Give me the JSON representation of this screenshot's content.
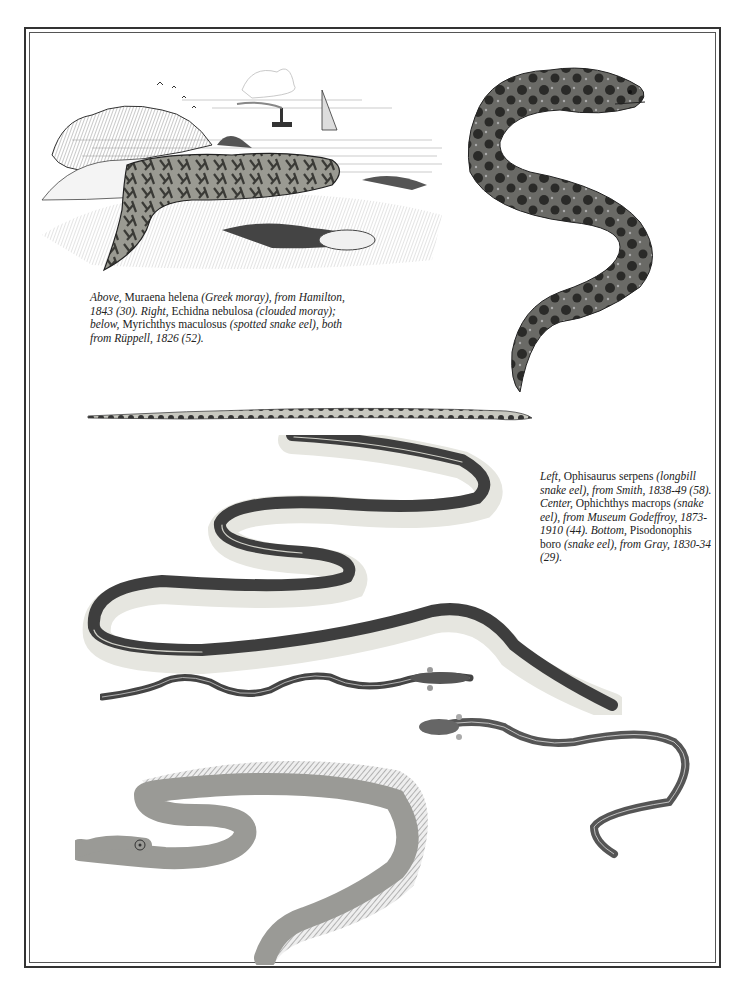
{
  "page": {
    "type": "illustrated plate",
    "background": "#ffffff",
    "ink": "#222222"
  },
  "captions": {
    "top_left": {
      "parts": [
        {
          "text": "Above,",
          "style": "italic"
        },
        {
          "text": " Muraena helena ",
          "style": "roman"
        },
        {
          "text": "(Greek moray), from Hamilton, 1843 (30). Right,",
          "style": "italic"
        },
        {
          "text": " Echidna nebulosa ",
          "style": "roman"
        },
        {
          "text": "(clouded moray); below,",
          "style": "italic"
        },
        {
          "text": " Myrichthys maculosus ",
          "style": "roman"
        },
        {
          "text": "(spotted snake eel), both from Rüppell, 1826 (52).",
          "style": "italic"
        }
      ]
    },
    "right": {
      "parts": [
        {
          "text": "Left,",
          "style": "italic"
        },
        {
          "text": " Ophisaurus serpens ",
          "style": "roman"
        },
        {
          "text": "(longbill snake eel), from Smith, 1838-49 (58). Center,",
          "style": "italic"
        },
        {
          "text": " Ophichthys macrops ",
          "style": "roman"
        },
        {
          "text": "(snake eel), from Museum Godeffroy, 1873-1910 (44). Bottom,",
          "style": "italic"
        },
        {
          "text": " Pisodonophis boro ",
          "style": "roman"
        },
        {
          "text": "(snake eel), from Gray, 1830-34 (29).",
          "style": "italic"
        }
      ]
    }
  },
  "illustrations": [
    {
      "id": "greek-moray",
      "species": "Muraena helena",
      "common": "Greek moray",
      "position": "top-left",
      "scene": "coastal engraving with cliffs, birds, steamship and sailboat"
    },
    {
      "id": "clouded-moray",
      "species": "Echidna nebulosa",
      "common": "clouded moray",
      "position": "top-right"
    },
    {
      "id": "spotted-snake-eel",
      "species": "Myrichthys maculosus",
      "common": "spotted snake eel",
      "position": "middle band"
    },
    {
      "id": "longbill-snake-eel",
      "species": "Ophisaurus serpens",
      "common": "longbill snake eel",
      "position": "center"
    },
    {
      "id": "snake-eel-macrops",
      "species": "Ophichthys macrops",
      "common": "snake eel",
      "position": "center-lower"
    },
    {
      "id": "snake-eel-boro",
      "species": "Pisodonophis boro",
      "common": "snake eel",
      "position": "lower-right"
    },
    {
      "id": "finned-eel",
      "species": "",
      "common": "",
      "position": "bottom-left"
    }
  ]
}
